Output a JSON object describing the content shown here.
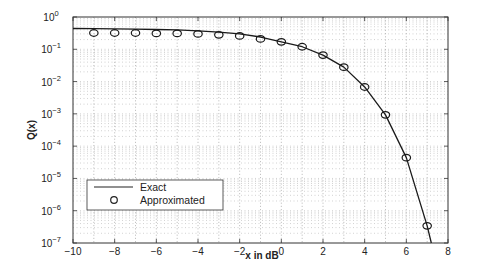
{
  "chart_data": {
    "type": "line",
    "title": "",
    "xlabel": "x in dB",
    "ylabel": "Q(x)",
    "xlim": [
      -10,
      8
    ],
    "ylim": [
      1e-07,
      1
    ],
    "yscale": "log",
    "grid": true,
    "x_ticks": [
      -10,
      -8,
      -6,
      -4,
      -2,
      0,
      2,
      4,
      6,
      8
    ],
    "x_tick_labels": [
      "−10",
      "−8",
      "−6",
      "−4",
      "−2",
      "0",
      "2",
      "4",
      "6",
      "8"
    ],
    "y_ticks_exp": [
      0,
      -1,
      -2,
      -3,
      -4,
      -5,
      -6,
      -7
    ],
    "legend": {
      "position": "lower left",
      "entries": [
        "Exact",
        "Approximated"
      ]
    },
    "series": [
      {
        "name": "Exact",
        "style": "line",
        "x": [
          -10,
          -9,
          -8,
          -7,
          -6,
          -5,
          -4,
          -3,
          -2,
          -1,
          0,
          1,
          2,
          3,
          4,
          5,
          6,
          7,
          7.2
        ],
        "values": [
          0.44,
          0.435,
          0.43,
          0.42,
          0.41,
          0.4,
          0.37,
          0.34,
          0.3,
          0.24,
          0.17,
          0.12,
          0.066,
          0.028,
          0.0068,
          0.00093,
          4.4e-05,
          3.4e-07,
          1e-07
        ]
      },
      {
        "name": "Approximated",
        "style": "marker-circle",
        "x": [
          -9,
          -8,
          -7,
          -6,
          -5,
          -4,
          -3,
          -2,
          -1,
          0,
          1,
          2,
          3,
          4,
          5,
          6,
          7
        ],
        "values": [
          0.32,
          0.32,
          0.32,
          0.31,
          0.31,
          0.3,
          0.28,
          0.26,
          0.21,
          0.17,
          0.12,
          0.066,
          0.028,
          0.0068,
          0.00093,
          4.4e-05,
          3.4e-07
        ]
      }
    ]
  },
  "labels": {
    "xlabel": "x in dB",
    "ylabel": "Q(x)",
    "legend_exact": "Exact",
    "legend_approx": "Approximated"
  }
}
